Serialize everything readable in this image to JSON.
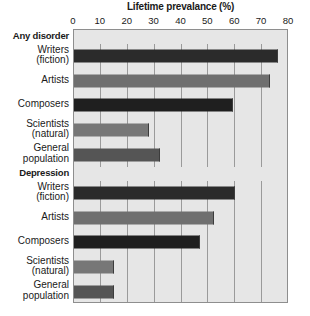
{
  "chart_data": {
    "type": "bar",
    "orientation": "horizontal",
    "title": "Lifetime prevalance (%)",
    "xlabel": "Lifetime prevalance (%)",
    "ylabel": "",
    "xlim": [
      0,
      80
    ],
    "xticks": [
      0,
      10,
      20,
      30,
      40,
      50,
      60,
      70,
      80
    ],
    "grid": true,
    "legend": "none",
    "groups": [
      {
        "name": "Any disorder",
        "categories": [
          "Writers (fiction)",
          "Artists",
          "Composers",
          "Scientists (natural)",
          "General population"
        ],
        "values": [
          76,
          73,
          59,
          28,
          32
        ]
      },
      {
        "name": "Depression",
        "categories": [
          "Writers (fiction)",
          "Artists",
          "Composers",
          "Scientists (natural)",
          "General population"
        ],
        "values": [
          60,
          52,
          47,
          15,
          15
        ]
      }
    ],
    "categories": [
      "Writers (fiction)",
      "Artists",
      "Composers",
      "Scientists (natural)",
      "General population"
    ],
    "series": [
      {
        "name": "Any disorder",
        "values": [
          76,
          73,
          59,
          28,
          32
        ]
      },
      {
        "name": "Depression",
        "values": [
          60,
          52,
          47,
          15,
          15
        ]
      }
    ],
    "bar_colors": [
      "#2b2b2b",
      "#6f6f6f",
      "#1f1f1f",
      "#777777",
      "#555555"
    ],
    "plot_background": "#e6e6e6",
    "gridline_color": "#9a9a9a",
    "axis_color": "#8e8e8e"
  },
  "axis": {
    "ticks": [
      "0",
      "10",
      "20",
      "30",
      "40",
      "50",
      "60",
      "70",
      "80"
    ]
  },
  "title": {
    "text": "Lifetime prevalance (%)"
  },
  "rows": [
    {
      "kind": "group",
      "line1": "Any disorder",
      "line2": "",
      "value": null,
      "color": ""
    },
    {
      "kind": "bar",
      "line1": "Writers",
      "line2": "(fiction)",
      "value": 76,
      "color": "#2b2b2b"
    },
    {
      "kind": "bar",
      "line1": "Artists",
      "line2": "",
      "value": 73,
      "color": "#6f6f6f"
    },
    {
      "kind": "bar",
      "line1": "Composers",
      "line2": "",
      "value": 59,
      "color": "#1f1f1f"
    },
    {
      "kind": "bar",
      "line1": "Scientists",
      "line2": "(natural)",
      "value": 28,
      "color": "#777777"
    },
    {
      "kind": "bar",
      "line1": "General",
      "line2": "population",
      "value": 32,
      "color": "#555555"
    },
    {
      "kind": "group",
      "line1": "Depression",
      "line2": "",
      "value": null,
      "color": ""
    },
    {
      "kind": "bar",
      "line1": "Writers",
      "line2": "(fiction)",
      "value": 60,
      "color": "#2b2b2b"
    },
    {
      "kind": "bar",
      "line1": "Artists",
      "line2": "",
      "value": 52,
      "color": "#6f6f6f"
    },
    {
      "kind": "bar",
      "line1": "Composers",
      "line2": "",
      "value": 47,
      "color": "#1f1f1f"
    },
    {
      "kind": "bar",
      "line1": "Scientists",
      "line2": "(natural)",
      "value": 15,
      "color": "#777777"
    },
    {
      "kind": "bar",
      "line1": "General",
      "line2": "population",
      "value": 15,
      "color": "#555555"
    }
  ]
}
